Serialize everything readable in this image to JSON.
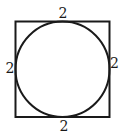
{
  "diagram": {
    "shapes": {
      "square": {
        "side_length": 2,
        "stroke_color": "#1a1a1a"
      },
      "circle": {
        "inscribed_in": "square",
        "stroke_color": "#1a1a1a"
      }
    },
    "labels": {
      "top": "2",
      "left": "2",
      "right": "2",
      "bottom": "2"
    }
  }
}
